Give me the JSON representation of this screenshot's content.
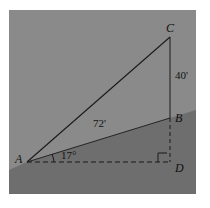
{
  "figure": {
    "background_upper_color": "#8a8a8a",
    "background_lower_color": "#6e6e6e",
    "line_color": "#1a1a1a",
    "vertices": [
      {
        "name": "A",
        "label": "A",
        "x": 18,
        "y": 152
      },
      {
        "name": "B",
        "label": "B",
        "x": 161,
        "y": 108
      },
      {
        "name": "C",
        "label": "C",
        "x": 161,
        "y": 27
      },
      {
        "name": "D",
        "label": "D",
        "x": 161,
        "y": 152
      }
    ],
    "measures": {
      "vertical_segment": "40'",
      "slope_segment": "72'",
      "angle": "17°"
    },
    "markers": {
      "right_angle": "right-angle-marker",
      "angle_arc": "angle-arc-marker"
    }
  }
}
